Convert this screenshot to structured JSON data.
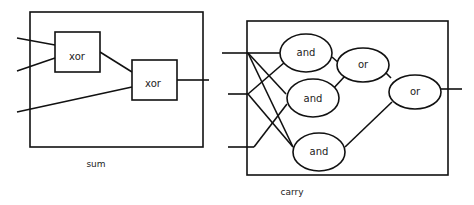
{
  "sum_circuit": {
    "caption": "sum",
    "gates": [
      {
        "id": "xor1",
        "label": "xor",
        "shape": "rect"
      },
      {
        "id": "xor2",
        "label": "xor",
        "shape": "rect"
      }
    ],
    "inputs": 3,
    "outputs": 1
  },
  "carry_circuit": {
    "caption": "carry",
    "gates": [
      {
        "id": "and1",
        "label": "and",
        "shape": "ellipse"
      },
      {
        "id": "and2",
        "label": "and",
        "shape": "ellipse"
      },
      {
        "id": "and3",
        "label": "and",
        "shape": "ellipse"
      },
      {
        "id": "or1",
        "label": "or",
        "shape": "ellipse"
      },
      {
        "id": "or2",
        "label": "or",
        "shape": "ellipse"
      }
    ],
    "inputs": 3,
    "outputs": 1
  }
}
